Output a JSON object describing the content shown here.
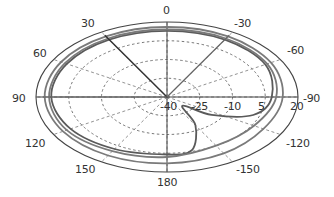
{
  "chart_data": {
    "type": "polar",
    "title": "",
    "angular_axis": {
      "direction": "counterclockwise",
      "zero_location": "top",
      "tick_labels": [
        "0",
        "30",
        "60",
        "90",
        "120",
        "150",
        "180",
        "-150",
        "-120",
        "-90",
        "-60",
        "-30"
      ],
      "tick_angles_deg": [
        0,
        30,
        60,
        90,
        120,
        150,
        180,
        -150,
        -120,
        -90,
        -60,
        -30
      ]
    },
    "radial_axis": {
      "range": [
        -40,
        20
      ],
      "tick_labels": [
        "-40",
        "-25",
        "-10",
        "5",
        "20"
      ],
      "tick_values": [
        -40,
        -25,
        -10,
        5,
        20
      ],
      "grid": "dashed"
    },
    "series": [
      {
        "name": "pattern-1 (outer)",
        "style": "solid gray",
        "points_deg_db": [
          [
            0,
            16
          ],
          [
            -30,
            16
          ],
          [
            -60,
            15
          ],
          [
            -90,
            13
          ],
          [
            -120,
            11
          ],
          [
            -150,
            12
          ],
          [
            180,
            13
          ],
          [
            150,
            14
          ],
          [
            120,
            15
          ],
          [
            90,
            16
          ],
          [
            60,
            16
          ],
          [
            30,
            16
          ]
        ]
      },
      {
        "name": "pattern-2 (inner, notched)",
        "style": "solid gray",
        "points_deg_db": [
          [
            0,
            13
          ],
          [
            -30,
            13
          ],
          [
            -60,
            12
          ],
          [
            -90,
            8
          ],
          [
            -110,
            2
          ],
          [
            -125,
            -15
          ],
          [
            -135,
            -30
          ],
          [
            -150,
            -14
          ],
          [
            -165,
            4
          ],
          [
            180,
            6
          ],
          [
            150,
            8
          ],
          [
            120,
            11
          ],
          [
            90,
            13
          ],
          [
            60,
            13
          ],
          [
            30,
            13
          ]
        ]
      },
      {
        "name": "pattern-3 (middle)",
        "style": "solid gray",
        "points_deg_db": [
          [
            0,
            14
          ],
          [
            -30,
            14
          ],
          [
            -60,
            13
          ],
          [
            -90,
            10
          ],
          [
            -120,
            6
          ],
          [
            -150,
            5
          ],
          [
            180,
            8
          ],
          [
            150,
            10
          ],
          [
            120,
            13
          ],
          [
            90,
            14
          ],
          [
            60,
            14
          ],
          [
            30,
            14
          ]
        ]
      }
    ],
    "annotations": {
      "highlight_radials_deg": [
        30,
        -30,
        90
      ]
    },
    "legend": "none",
    "grid": true
  }
}
